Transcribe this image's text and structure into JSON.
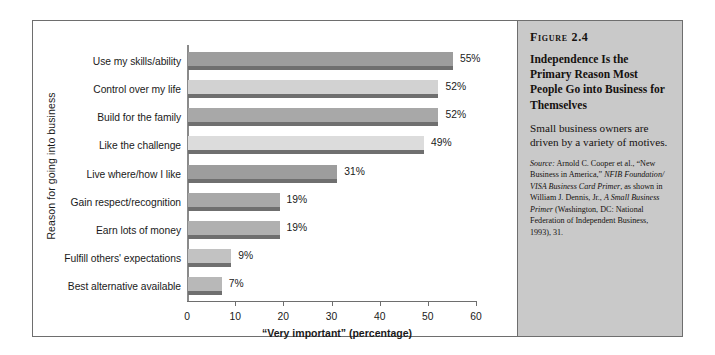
{
  "figure": {
    "number_label": "Figure 2.4",
    "title": "Independence Is the Primary Reason Most People Go into Business for Themselves",
    "description": "Small business owners are driven by a variety of motives.",
    "source_prefix": "Source:",
    "source_text": " Arnold C. Cooper et al., “New Business in America,” ",
    "source_italic_1": "NFIB Foundation/ VISA Business Card Primer",
    "source_mid": ", as shown in William J. Dennis, Jr., ",
    "source_italic_2": "A Small Business Primer",
    "source_end": " (Washington, DC: National Federation of Independent Business, 1993), 31.",
    "panel_color": "#c9c9c9"
  },
  "chart_data": {
    "type": "bar",
    "orientation": "horizontal",
    "title": "",
    "xlabel": "“Very important” (percentage)",
    "ylabel": "Reason for going into business",
    "xlim": [
      0,
      60
    ],
    "xticks": [
      0,
      10,
      20,
      30,
      40,
      50,
      60
    ],
    "xtick_labels": [
      "0",
      "10",
      "20",
      "30",
      "40",
      "50",
      "60"
    ],
    "grid": false,
    "legend": false,
    "categories": [
      "Use my skills/ability",
      "Control over my life",
      "Build for the family",
      "Like the challenge",
      "Live where/how I like",
      "Gain respect/recognition",
      "Earn lots of money",
      "Fulfill others' expectations",
      "Best alternative available"
    ],
    "values": [
      55,
      52,
      52,
      49,
      31,
      19,
      19,
      9,
      7
    ],
    "value_labels": [
      "55%",
      "52%",
      "52%",
      "49%",
      "31%",
      "19%",
      "19%",
      "9%",
      "7%"
    ],
    "bar_colors": [
      "#9d9d9d",
      "#d2d2d2",
      "#a8a8a8",
      "#dcdcdc",
      "#9d9d9d",
      "#a8a8a8",
      "#b0b0b0",
      "#c2c2c2",
      "#b8b8b8"
    ],
    "bar_shadow_color": "#6f6f6f"
  }
}
